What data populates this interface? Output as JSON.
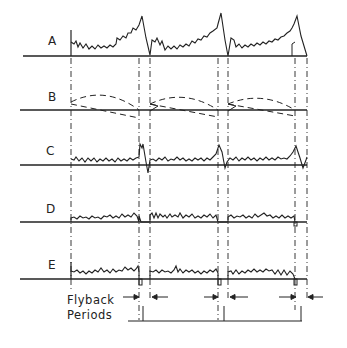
{
  "traces": [
    {
      "id": "A",
      "label": "A",
      "description": "sawtooth with noise, peaks before flyback"
    },
    {
      "id": "B",
      "label": "B",
      "description": "dashed parabolic and ramp waveforms"
    },
    {
      "id": "C",
      "label": "C",
      "description": "noise with bipolar spikes at flyback"
    },
    {
      "id": "D",
      "label": "D",
      "description": "noise with small notch at flyback"
    },
    {
      "id": "E",
      "label": "E",
      "description": "noise with negative pulses at flyback"
    }
  ],
  "annotation": {
    "line1": "Flyback",
    "line2": "Periods"
  },
  "colors": {
    "ink": "#222222",
    "background": "#ffffff"
  }
}
